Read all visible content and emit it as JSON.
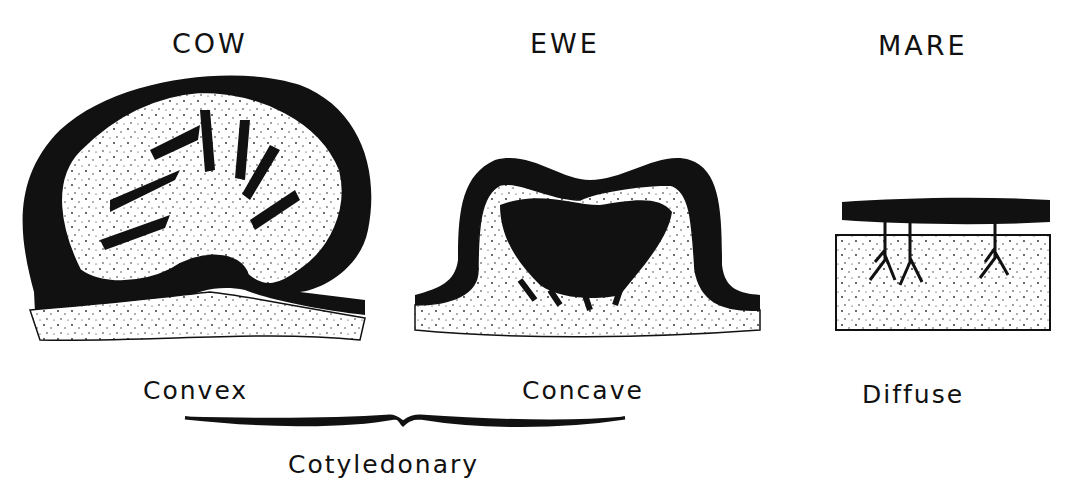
{
  "diagram": {
    "type": "placenta-types",
    "panels": [
      {
        "title": "COW",
        "shape": "Convex"
      },
      {
        "title": "EWE",
        "shape": "Concave"
      },
      {
        "title": "MARE",
        "shape": "Diffuse"
      }
    ],
    "group_label": "Cotyledonary",
    "colors": {
      "ink": "#111111",
      "background": "#ffffff"
    }
  }
}
